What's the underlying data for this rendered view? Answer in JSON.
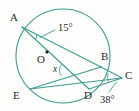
{
  "figure": {
    "stroke_color": "#3f9c93",
    "label_color": "#2b2b2b",
    "background_color": "#fdfdfb",
    "circle": {
      "cx": 63,
      "cy": 56,
      "r": 47
    },
    "center_marker": {
      "x": 47,
      "y": 52,
      "label": "O"
    },
    "points": [
      {
        "name": "A",
        "label": "A",
        "x": 22,
        "y": 27,
        "label_x": 10,
        "label_y": 12
      },
      {
        "name": "B",
        "label": "B",
        "x": 101,
        "y": 67,
        "label_x": 101,
        "label_y": 52
      },
      {
        "name": "C",
        "label": "C",
        "x": 122,
        "y": 78,
        "label_x": 125,
        "label_y": 70
      },
      {
        "name": "D",
        "label": "D",
        "x": 89,
        "y": 89,
        "label_x": 84,
        "label_y": 90
      },
      {
        "name": "E",
        "label": "E",
        "x": 30,
        "y": 89,
        "label_x": 14,
        "label_y": 90
      }
    ],
    "segments": [
      {
        "name": "chord-a-to-b",
        "from": "A",
        "to": "B"
      },
      {
        "name": "chord-a-to-d",
        "from": "A",
        "to": "D"
      },
      {
        "name": "chord-e-to-b",
        "from": "E",
        "to": "B"
      },
      {
        "name": "chord-e-to-d",
        "from": "E",
        "to": "D"
      },
      {
        "name": "secant-b-to-c",
        "from": "B",
        "to": "C"
      },
      {
        "name": "secant-d-to-c",
        "from": "D",
        "to": "C"
      }
    ],
    "angles": [
      {
        "name": "angle-at-a",
        "label": "15°",
        "value": 15,
        "vertex": "A",
        "label_x": 58,
        "label_y": 24
      },
      {
        "name": "angle-x-at-intersection",
        "label": "x",
        "value": null,
        "vertex": "chord-intersection",
        "label_x": 53,
        "label_y": 66
      },
      {
        "name": "angle-at-c",
        "label": "38°",
        "value": 38,
        "vertex": "C",
        "label_x": 101,
        "label_y": 95
      }
    ],
    "leaders": [
      {
        "name": "leader-15-degrees",
        "x1": 55,
        "y1": 30,
        "x2": 40,
        "y2": 38
      },
      {
        "name": "leader-38-degrees",
        "x1": 110,
        "y1": 92,
        "x2": 117,
        "y2": 82
      }
    ]
  }
}
